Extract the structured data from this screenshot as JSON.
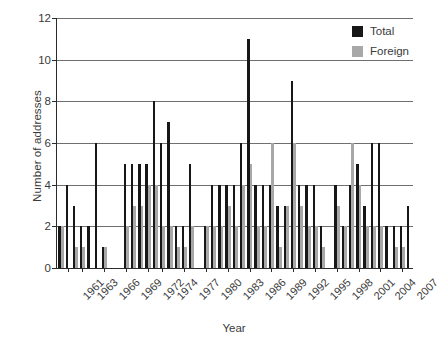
{
  "chart_data": {
    "type": "bar",
    "title": "",
    "xlabel": "Year",
    "ylabel": "Number of addresses",
    "ylim": [
      0,
      12
    ],
    "yticks": [
      0,
      2,
      4,
      6,
      8,
      10,
      12
    ],
    "grid": "horizontal",
    "legend_position": "top-right",
    "colors": {
      "total": "#171717",
      "foreign": "#a8a8a8",
      "axis": "#2b2b2b",
      "grid": "#6f6f6f",
      "text": "#3a3a3a",
      "background": "#ffffff"
    },
    "legend": [
      {
        "name": "Total",
        "color": "#171717"
      },
      {
        "name": "Foreign",
        "color": "#a8a8a8"
      }
    ],
    "xtick_labels": [
      "1961",
      "1963",
      "1966",
      "1969",
      "1972",
      "1974",
      "1977",
      "1980",
      "1983",
      "1986",
      "1989",
      "1992",
      "1995",
      "1998",
      "2001",
      "2004",
      "2007"
    ],
    "xtick_years": [
      1961,
      1963,
      1966,
      1969,
      1972,
      1974,
      1977,
      1980,
      1983,
      1986,
      1989,
      1992,
      1995,
      1998,
      2001,
      2004,
      2007
    ],
    "categories": [
      1960,
      1961,
      1962,
      1963,
      1964,
      1965,
      1966,
      1967,
      1968,
      1969,
      1970,
      1971,
      1972,
      1973,
      1974,
      1975,
      1976,
      1977,
      1978,
      1979,
      1980,
      1981,
      1982,
      1983,
      1984,
      1985,
      1986,
      1987,
      1988,
      1989,
      1990,
      1991,
      1992,
      1993,
      1994,
      1995,
      1996,
      1997,
      1998,
      1999,
      2000,
      2001,
      2002,
      2003,
      2004,
      2005,
      2006,
      2007,
      2008
    ],
    "series": [
      {
        "name": "Total",
        "color": "#171717",
        "values": [
          2,
          4,
          3,
          2,
          2,
          6,
          1,
          0,
          0,
          5,
          5,
          5,
          5,
          8,
          6,
          7,
          2,
          2,
          5,
          0,
          2,
          4,
          4,
          4,
          4,
          6,
          11,
          4,
          4,
          4,
          3,
          3,
          9,
          4,
          4,
          4,
          2,
          0,
          4,
          2,
          4,
          5,
          3,
          6,
          6,
          2,
          2,
          2,
          3
        ]
      },
      {
        "name": "Foreign",
        "color": "#a8a8a8",
        "values": [
          2,
          0,
          1,
          1,
          0,
          0,
          1,
          0,
          0,
          2,
          3,
          3,
          4,
          4,
          2,
          2,
          1,
          1,
          2,
          0,
          2,
          2,
          2,
          3,
          2,
          4,
          5,
          2,
          2,
          6,
          1,
          3,
          6,
          3,
          2,
          2,
          1,
          0,
          3,
          2,
          6,
          4,
          2,
          2,
          2,
          0,
          1,
          1,
          0
        ]
      }
    ]
  }
}
